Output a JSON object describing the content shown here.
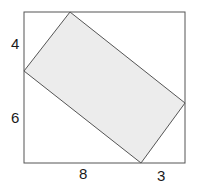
{
  "diagram": {
    "type": "rectangle inscribed in square",
    "square": {
      "x": 24,
      "y": 12,
      "width": 161,
      "height": 151
    },
    "rectangle_vertices": [
      [
        70,
        12
      ],
      [
        185,
        103
      ],
      [
        141,
        163
      ],
      [
        24,
        71
      ]
    ],
    "colors": {
      "stroke": "#555555",
      "fill": "#ececec",
      "text": "#1a1a1a"
    },
    "labels": {
      "left_top": "4",
      "left_bottom": "6",
      "bottom_left": "8",
      "bottom_right": "3"
    }
  }
}
